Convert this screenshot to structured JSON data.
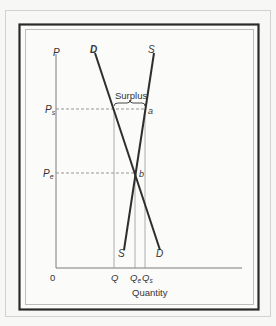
{
  "figure": {
    "type": "supply-demand surplus diagram",
    "axes": {
      "y_label": "P",
      "x_label": "Quantity",
      "origin_label": "0"
    },
    "curves": {
      "demand": {
        "top_label": "D",
        "bottom_label": "D"
      },
      "supply": {
        "top_label": "S",
        "bottom_label": "S"
      }
    },
    "price_levels": {
      "surplus_price": {
        "label": "P",
        "subscript": "s"
      },
      "equilibrium_price": {
        "label": "P",
        "subscript": "e"
      }
    },
    "quantity_levels": {
      "quantity_demanded": {
        "label": "Q",
        "subscript": ""
      },
      "equilibrium_quantity": {
        "label": "Q",
        "subscript": "e"
      },
      "quantity_supplied": {
        "label": "Q",
        "subscript": "s"
      }
    },
    "points": {
      "a": "a",
      "b": "b"
    },
    "annotation": "Surplus"
  },
  "colors": {
    "background": "#f7f7f5",
    "frame_dark": "#2a2a2a",
    "frame_light": "#c8c8c8",
    "curve": "#2e2e2e",
    "guide": "#8a8a8a",
    "text": "#333333"
  }
}
